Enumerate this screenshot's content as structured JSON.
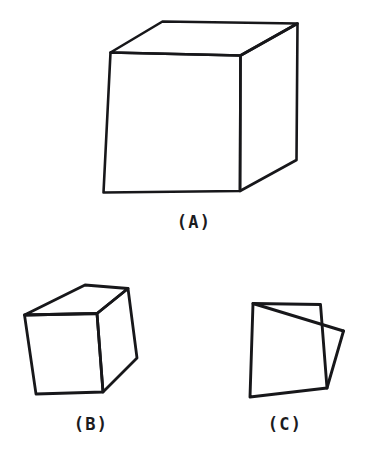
{
  "figure": {
    "background_color": "#ffffff",
    "ink_color": "#17171a",
    "width": 388,
    "height": 461,
    "panels": [
      {
        "id": "a",
        "label": "(A)",
        "description": "well-formed cube drawing",
        "stroke_width": 2.6,
        "paths": [
          "M 110.5 52.5 L 162.5 21.5 L 297.5 23.5 L 240.5 55.5 Z",
          "M 110.5 52.5 L 103.5 192.5 L 240.0 191.0 L 240.5 55.5 Z",
          "M 240.5 55.5 L 297.5 23.5 L 296.5 160.0 L 240.0 191.0 Z"
        ]
      },
      {
        "id": "b",
        "label": "(B)",
        "description": "distorted hand-drawn cube",
        "stroke_width": 2.8,
        "paths": [
          "M 24.5 315.0 L 85.0 285.0 L 128.0 288.5 L 97.0 313.5 Z",
          "M 24.5 315.0 L 36.0 394.0 L 103.0 392.0 L 97.0 313.5 Z",
          "M 97.0 313.5 L 128.0 288.5 L 137.0 358.0 L 103.0 392.0 Z"
        ]
      },
      {
        "id": "c",
        "label": "(C)",
        "description": "degenerate incoherent cube drawing",
        "stroke_width": 2.9,
        "paths": [
          "M 253.0 303.5 L 320.5 304.5 L 327.0 388.0 L 250.0 397.0 Z",
          "M 253.0 303.5 L 343.5 331.0",
          "M 343.5 331.0 L 327.0 388.0"
        ]
      }
    ]
  }
}
